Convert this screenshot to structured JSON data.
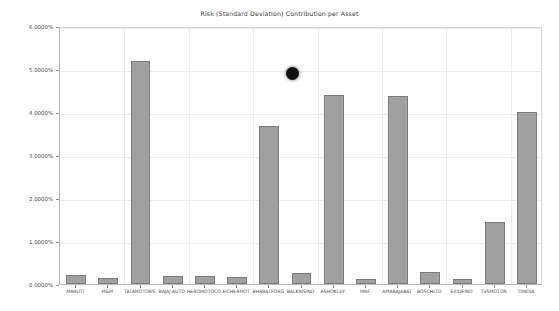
{
  "chart_data": {
    "type": "bar",
    "title": "Risk (Standard Deviation) Contribution per Asset",
    "xlabel": "",
    "ylabel": "",
    "ylim": [
      0,
      6
    ],
    "grid": true,
    "legend": "none",
    "y_tick_labels": [
      "6.0000%",
      "5.0000%",
      "4.0000%",
      "3.0000%",
      "2.0000%",
      "1.0000%",
      "0.0000%"
    ],
    "y_tick_values": [
      6,
      5,
      4,
      3,
      2,
      1,
      0
    ],
    "categories": [
      "MARUTI",
      "M&M",
      "TATAMOTORS",
      "BAJAJ-AUTO",
      "HEROMOTOCO",
      "EICHERMOT",
      "BHARATFORG",
      "BALKRISIND",
      "ASHOKLEY",
      "MRF",
      "AMARAJABAT",
      "BOSCHLTD",
      "EXIDEIND",
      "TVSMOTOR",
      "TIINDIA"
    ],
    "values": [
      0.22,
      0.13,
      5.19,
      0.18,
      0.18,
      0.17,
      3.67,
      0.25,
      4.4,
      0.12,
      4.38,
      0.28,
      0.12,
      1.45,
      4.0
    ],
    "bar_color": "#a0a0a0",
    "bar_edge_color": "#7c7c7c"
  },
  "overlay": {
    "cursor_dot_label": "cursor-dot"
  }
}
